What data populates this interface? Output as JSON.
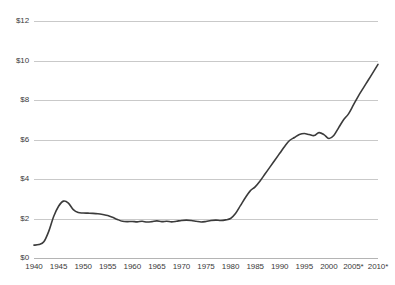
{
  "chart_data": {
    "type": "line",
    "title": "",
    "subtitle": "",
    "xlabel": "",
    "ylabel": "",
    "xlim": [
      1940,
      2010
    ],
    "ylim": [
      0,
      12
    ],
    "grid": true,
    "legend": false,
    "legend_position": "none",
    "y_tick_labels": [
      "$12",
      "$10",
      "$8",
      "$6",
      "$4",
      "$2",
      "$0"
    ],
    "y_ticks": [
      12,
      10,
      8,
      6,
      4,
      2,
      0
    ],
    "x_tick_labels": [
      "1940",
      "1945",
      "1950",
      "1955",
      "1960",
      "1965",
      "1970",
      "1975",
      "1980",
      "1985",
      "1990",
      "1995",
      "2000",
      "2005*",
      "2010*"
    ],
    "x_ticks": [
      1940,
      1945,
      1950,
      1955,
      1960,
      1965,
      1970,
      1975,
      1980,
      1985,
      1990,
      1995,
      2000,
      2005,
      2010
    ],
    "line_color": "#3b3b3b",
    "grid_color": "#c9c9c9",
    "series": [
      {
        "name": "price",
        "x": [
          1940,
          1941,
          1942,
          1943,
          1944,
          1945,
          1946,
          1947,
          1948,
          1949,
          1950,
          1951,
          1952,
          1953,
          1954,
          1955,
          1956,
          1957,
          1958,
          1959,
          1960,
          1961,
          1962,
          1963,
          1964,
          1965,
          1966,
          1967,
          1968,
          1969,
          1970,
          1971,
          1972,
          1973,
          1974,
          1975,
          1976,
          1977,
          1978,
          1979,
          1980,
          1981,
          1982,
          1983,
          1984,
          1985,
          1986,
          1987,
          1988,
          1989,
          1990,
          1991,
          1992,
          1993,
          1994,
          1995,
          1996,
          1997,
          1998,
          1999,
          2000,
          2001,
          2002,
          2003,
          2004,
          2005,
          2006,
          2007,
          2008,
          2009,
          2010
        ],
        "values": [
          0.65,
          0.68,
          0.82,
          1.35,
          2.1,
          2.62,
          2.88,
          2.78,
          2.45,
          2.3,
          2.28,
          2.27,
          2.26,
          2.24,
          2.2,
          2.15,
          2.06,
          1.95,
          1.86,
          1.84,
          1.85,
          1.83,
          1.86,
          1.82,
          1.84,
          1.88,
          1.84,
          1.86,
          1.83,
          1.86,
          1.9,
          1.92,
          1.9,
          1.86,
          1.82,
          1.85,
          1.9,
          1.92,
          1.9,
          1.93,
          2.0,
          2.25,
          2.65,
          3.05,
          3.4,
          3.6,
          3.9,
          4.25,
          4.6,
          4.95,
          5.3,
          5.65,
          5.95,
          6.1,
          6.25,
          6.3,
          6.25,
          6.2,
          6.35,
          6.25,
          6.05,
          6.2,
          6.6,
          7.0,
          7.3,
          7.75,
          8.2,
          8.6,
          9.0,
          9.4,
          9.8
        ]
      }
    ]
  },
  "axes": {
    "y_labels": [
      {
        "text": "$12",
        "value": 12
      },
      {
        "text": "$10",
        "value": 10
      },
      {
        "text": "$8",
        "value": 8
      },
      {
        "text": "$6",
        "value": 6
      },
      {
        "text": "$4",
        "value": 4
      },
      {
        "text": "$2",
        "value": 2
      },
      {
        "text": "$0",
        "value": 0
      }
    ],
    "x_labels": [
      {
        "text": "1940",
        "value": 1940
      },
      {
        "text": "1945",
        "value": 1945
      },
      {
        "text": "1950",
        "value": 1950
      },
      {
        "text": "1955",
        "value": 1955
      },
      {
        "text": "1960",
        "value": 1960
      },
      {
        "text": "1965",
        "value": 1965
      },
      {
        "text": "1970",
        "value": 1970
      },
      {
        "text": "1975",
        "value": 1975
      },
      {
        "text": "1980",
        "value": 1980
      },
      {
        "text": "1985",
        "value": 1985
      },
      {
        "text": "1990",
        "value": 1990
      },
      {
        "text": "1995",
        "value": 1995
      },
      {
        "text": "2000",
        "value": 2000
      },
      {
        "text": "2005*",
        "value": 2005
      },
      {
        "text": "2010*",
        "value": 2010
      }
    ]
  }
}
